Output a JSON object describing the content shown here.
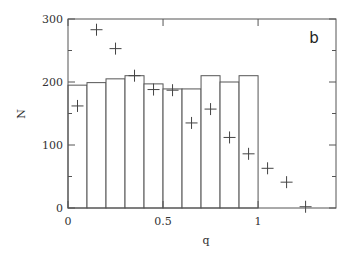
{
  "chart_data": {
    "type": "bar",
    "title": "",
    "panel_label": "b",
    "xlabel": "q",
    "ylabel": "N",
    "xlim": [
      0,
      1.41
    ],
    "ylim": [
      0,
      300
    ],
    "grid": false,
    "legend": null,
    "x_ticks": [
      0,
      0.5,
      1
    ],
    "x_tick_labels": [
      "0",
      "0.5",
      "1"
    ],
    "y_ticks": [
      0,
      100,
      200,
      300
    ],
    "y_tick_labels": [
      "0",
      "100",
      "200",
      "300"
    ],
    "y_minor_ticks": [
      50,
      150,
      250
    ],
    "histogram": {
      "name": "histogram",
      "bin_edges": [
        0,
        0.1,
        0.2,
        0.3,
        0.4,
        0.5,
        0.6,
        0.7,
        0.8,
        0.9,
        1.0
      ],
      "values": [
        195,
        199,
        205,
        210,
        197,
        189,
        189,
        210,
        200,
        210
      ]
    },
    "series": [
      {
        "name": "points",
        "marker": "plus",
        "x": [
          0.05,
          0.15,
          0.25,
          0.35,
          0.45,
          0.55,
          0.65,
          0.75,
          0.85,
          0.95,
          1.05,
          1.15,
          1.25
        ],
        "values": [
          162,
          283,
          253,
          210,
          188,
          187,
          135,
          157,
          112,
          86,
          63,
          41,
          2
        ]
      }
    ]
  }
}
